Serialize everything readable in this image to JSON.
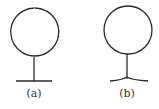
{
  "figures": [
    {
      "id": "a",
      "label": "(a)",
      "shape": "circle-on-stem-flat-base"
    },
    {
      "id": "b",
      "label": "(b)",
      "shape": "circle-on-stem-curved-base"
    }
  ],
  "colors": {
    "stroke": "#2a2a2a",
    "background": "#ffffff"
  }
}
